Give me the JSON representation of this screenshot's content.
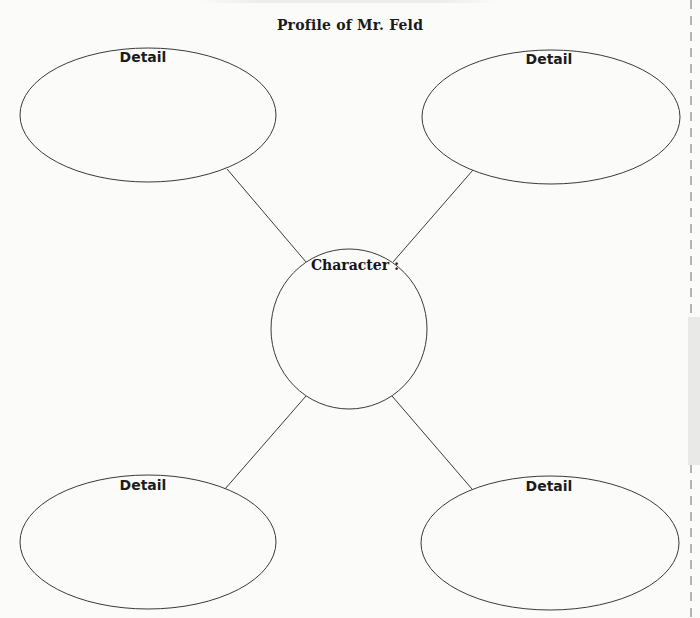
{
  "diagram": {
    "title": "Profile of Mr. Feld",
    "center": {
      "label": "Character :",
      "shape": "circle",
      "value": ""
    },
    "details": [
      {
        "position": "top-left",
        "label": "Detail",
        "value": ""
      },
      {
        "position": "top-right",
        "label": "Detail",
        "value": ""
      },
      {
        "position": "bottom-left",
        "label": "Detail",
        "value": ""
      },
      {
        "position": "bottom-right",
        "label": "Detail",
        "value": ""
      }
    ],
    "colors": {
      "stroke": "#3a3a3a",
      "text": "#1a1a1a",
      "background": "#fbfbfa"
    }
  }
}
